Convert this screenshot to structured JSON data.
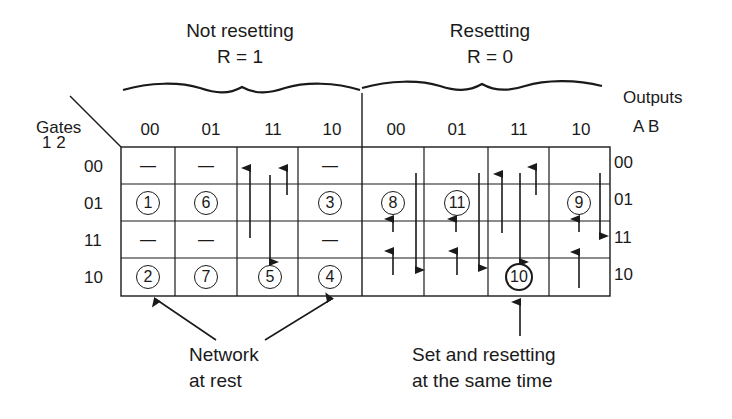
{
  "headers": {
    "left_group": {
      "line1": "Not resetting",
      "line2": "R = 1"
    },
    "right_group": {
      "line1": "Resetting",
      "line2": "R = 0"
    },
    "gates_label": "Gates",
    "gates_sub": "1 2",
    "outputs_label": "Outputs",
    "outputs_sub": "A B"
  },
  "columns": [
    "00",
    "01",
    "11",
    "10",
    "00",
    "01",
    "11",
    "10"
  ],
  "rows": [
    "00",
    "01",
    "11",
    "10"
  ],
  "output_rows": [
    "00",
    "01",
    "11",
    "10"
  ],
  "cells": {
    "r0": [
      "—",
      "—",
      "",
      "—",
      "",
      "",
      "",
      ""
    ],
    "r1": [
      "1",
      "6",
      "",
      "3",
      "8",
      "11",
      "",
      "9"
    ],
    "r2": [
      "—",
      "—",
      "",
      "—",
      "",
      "",
      "",
      ""
    ],
    "r3": [
      "2",
      "7",
      "5",
      "4",
      "",
      "",
      "10",
      ""
    ]
  },
  "annotations": {
    "rest": {
      "line1": "Network",
      "line2": "at rest"
    },
    "set_reset": {
      "line1": "Set and resetting",
      "line2": "at the same time"
    }
  }
}
